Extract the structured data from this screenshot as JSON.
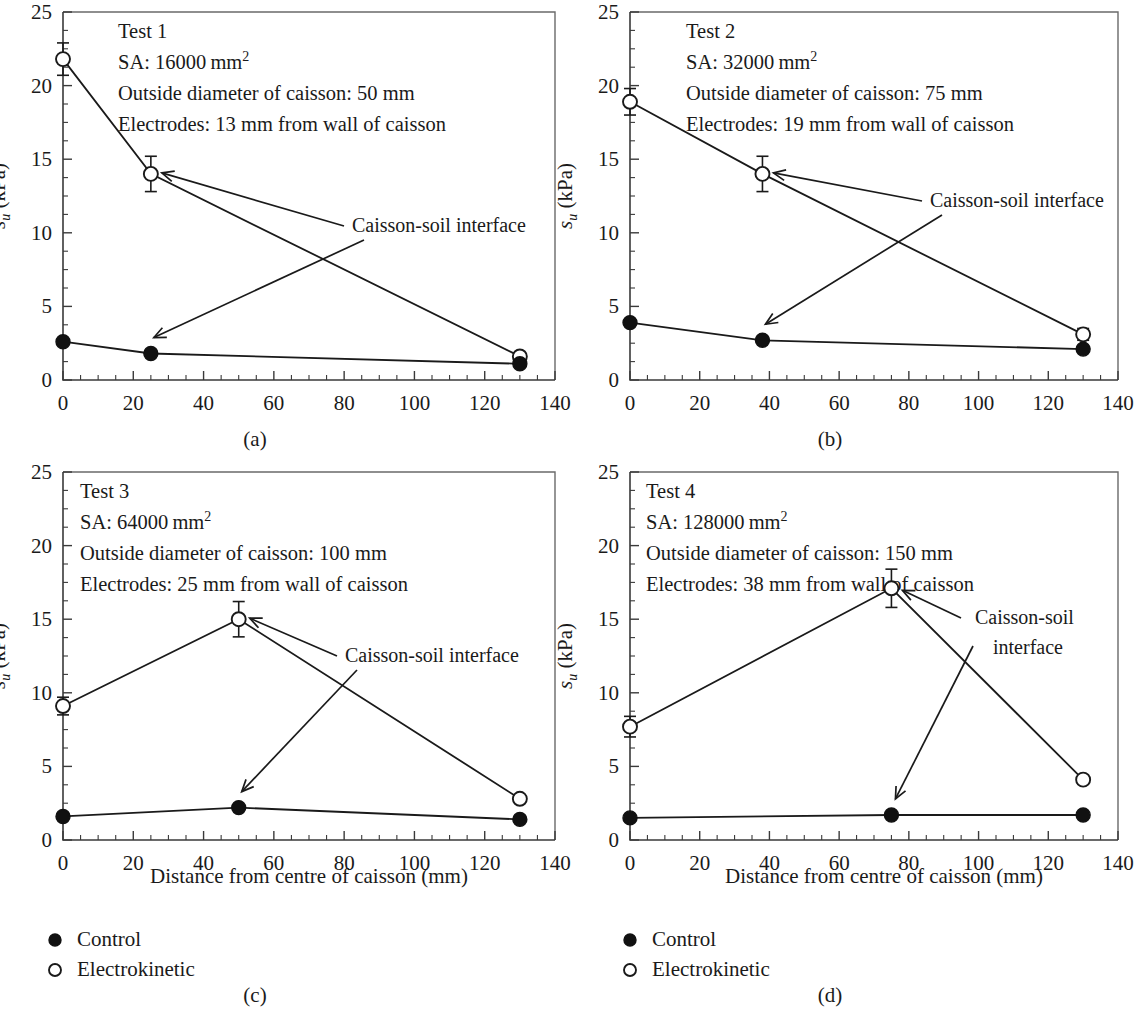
{
  "figure": {
    "axis_x_title": "Distance from centre of caisson (mm)",
    "y_axis_symbol": "s",
    "y_axis_subscript": "u",
    "y_axis_unit": " (kPa)",
    "x_ticks": [
      "0",
      "20",
      "40",
      "60",
      "80",
      "100",
      "120",
      "140"
    ],
    "y_ticks": [
      "0",
      "5",
      "10",
      "15",
      "20",
      "25"
    ],
    "panel_labels": [
      "(a)",
      "(b)",
      "(c)",
      "(d)"
    ],
    "annotation": "Caisson-soil interface",
    "annotation_line1": "Caisson-soil",
    "annotation_line2": "interface",
    "legend": {
      "control_label": "Control",
      "electrokinetic_label": "Electrokinetic"
    },
    "colors": {
      "ink": "#1a1a1a",
      "frame": "#6a6a6a",
      "marker_fill": "#111111",
      "marker_open": "#ffffff",
      "background": "#ffffff"
    }
  },
  "chart_data": [
    {
      "type": "line",
      "panel": "(a)",
      "title": "Test 1",
      "info_lines": [
        "Test 1",
        "SA: 16000 mm",
        "Outside diameter of caisson: 50 mm",
        "Electrodes: 13 mm from wall of caisson"
      ],
      "sa_value": "16000",
      "sa_unit": "mm",
      "sa_exponent": "2",
      "outside_diameter": "50 mm",
      "electrode_distance": "13 mm",
      "xlabel": "Distance from centre of caisson (mm)",
      "ylabel": "s_u (kPa)",
      "xlim": [
        0,
        140
      ],
      "ylim": [
        0,
        25
      ],
      "x": [
        0,
        25,
        130
      ],
      "series": [
        {
          "name": "Electrokinetic",
          "marker": "open-circle",
          "values": [
            21.8,
            14.0,
            1.6
          ],
          "errors": [
            1.1,
            1.2,
            0.0
          ]
        },
        {
          "name": "Control",
          "marker": "filled-circle",
          "values": [
            2.6,
            1.8,
            1.1
          ],
          "errors": [
            0.0,
            0.0,
            0.0
          ]
        }
      ],
      "annotations": [
        {
          "text": "Caisson-soil interface",
          "target_x": 25,
          "target_y": 14.0
        },
        {
          "text": "Caisson-soil interface",
          "target_x": 25,
          "target_y": 1.8
        }
      ]
    },
    {
      "type": "line",
      "panel": "(b)",
      "title": "Test 2",
      "info_lines": [
        "Test 2",
        "SA: 32000 mm",
        "Outside diameter of caisson: 75 mm",
        "Electrodes: 19 mm from wall of caisson"
      ],
      "sa_value": "32000",
      "sa_unit": "mm",
      "sa_exponent": "2",
      "outside_diameter": "75 mm",
      "electrode_distance": "19 mm",
      "xlabel": "Distance from centre of caisson (mm)",
      "ylabel": "s_u (kPa)",
      "xlim": [
        0,
        140
      ],
      "ylim": [
        0,
        25
      ],
      "x": [
        0,
        38,
        130
      ],
      "series": [
        {
          "name": "Electrokinetic",
          "marker": "open-circle",
          "values": [
            18.9,
            14.0,
            3.1
          ],
          "errors": [
            0.9,
            1.2,
            0.4
          ]
        },
        {
          "name": "Control",
          "marker": "filled-circle",
          "values": [
            3.9,
            2.7,
            2.1
          ],
          "errors": [
            0.0,
            0.0,
            0.0
          ]
        }
      ],
      "annotations": [
        {
          "text": "Caisson-soil interface",
          "target_x": 38,
          "target_y": 14.0
        },
        {
          "text": "Caisson-soil interface",
          "target_x": 38,
          "target_y": 2.7
        }
      ]
    },
    {
      "type": "line",
      "panel": "(c)",
      "title": "Test 3",
      "info_lines": [
        "Test 3",
        "SA: 64000 mm",
        "Outside diameter of caisson: 100 mm",
        "Electrodes: 25 mm from wall of caisson"
      ],
      "sa_value": "64000",
      "sa_unit": "mm",
      "sa_exponent": "2",
      "outside_diameter": "100 mm",
      "electrode_distance": "25 mm",
      "xlabel": "Distance from centre of caisson (mm)",
      "ylabel": "s_u (kPa)",
      "xlim": [
        0,
        140
      ],
      "ylim": [
        0,
        25
      ],
      "x": [
        0,
        50,
        130
      ],
      "series": [
        {
          "name": "Electrokinetic",
          "marker": "open-circle",
          "values": [
            9.1,
            15.0,
            2.8
          ],
          "errors": [
            0.6,
            1.2,
            0.0
          ]
        },
        {
          "name": "Control",
          "marker": "filled-circle",
          "values": [
            1.6,
            2.2,
            1.4
          ],
          "errors": [
            0.0,
            0.0,
            0.0
          ]
        }
      ],
      "annotations": [
        {
          "text": "Caisson-soil interface",
          "target_x": 50,
          "target_y": 15.0
        },
        {
          "text": "Caisson-soil interface",
          "target_x": 50,
          "target_y": 2.2
        }
      ]
    },
    {
      "type": "line",
      "panel": "(d)",
      "title": "Test 4",
      "info_lines": [
        "Test 4",
        "SA: 128000 mm",
        "Outside diameter of caisson: 150 mm",
        "Electrodes: 38 mm from wall of caisson"
      ],
      "sa_value": "128000",
      "sa_unit": "mm",
      "sa_exponent": "2",
      "outside_diameter": "150 mm",
      "electrode_distance": "38 mm",
      "xlabel": "Distance from centre of caisson (mm)",
      "ylabel": "s_u (kPa)",
      "xlim": [
        0,
        140
      ],
      "ylim": [
        0,
        25
      ],
      "x": [
        0,
        75,
        130
      ],
      "series": [
        {
          "name": "Electrokinetic",
          "marker": "open-circle",
          "values": [
            7.7,
            17.1,
            4.1
          ],
          "errors": [
            0.7,
            1.3,
            0.3
          ]
        },
        {
          "name": "Control",
          "marker": "filled-circle",
          "values": [
            1.5,
            1.7,
            1.7
          ],
          "errors": [
            0.0,
            0.0,
            0.0
          ]
        }
      ],
      "annotations": [
        {
          "text": "Caisson-soil",
          "target_x": 75,
          "target_y": 17.1
        },
        {
          "text": "interface",
          "target_x": 75,
          "target_y": 1.7
        }
      ]
    }
  ]
}
